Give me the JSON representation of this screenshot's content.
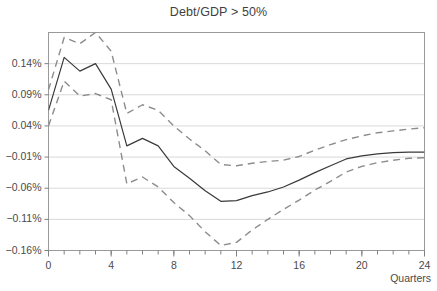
{
  "chart_data": {
    "type": "line",
    "title": "Debt/GDP > 50%",
    "xlabel": "Quarters",
    "ylabel": "",
    "xlim": [
      0,
      24
    ],
    "ylim": [
      -0.16,
      0.19
    ],
    "grid": true,
    "legend": false,
    "x": [
      0,
      1,
      2,
      3,
      4,
      5,
      6,
      7,
      8,
      9,
      10,
      11,
      12,
      13,
      14,
      15,
      16,
      17,
      18,
      19,
      20,
      21,
      22,
      23,
      24
    ],
    "xticks": [
      0,
      4,
      8,
      12,
      16,
      20,
      24
    ],
    "xtick_labels": [
      "0",
      "4",
      "8",
      "12",
      "16",
      "20",
      "24"
    ],
    "xminor_ticks": [
      0,
      1,
      2,
      3,
      4,
      5,
      6,
      7,
      8,
      9,
      10,
      11,
      12,
      13,
      14,
      15,
      16,
      17,
      18,
      19,
      20,
      21,
      22,
      23,
      24
    ],
    "yticks": [
      0.14,
      0.09,
      0.04,
      -0.01,
      -0.06,
      -0.11,
      -0.16
    ],
    "ytick_labels": [
      "0.14%",
      "0.09%",
      "0.04%",
      "−0.01%",
      "−0.06%",
      "−0.11%",
      "−0.16%"
    ],
    "series": [
      {
        "name": "point-estimate",
        "style": "solid",
        "color": "#3a3a3a",
        "values": [
          0.065,
          0.15,
          0.128,
          0.14,
          0.099,
          0.008,
          0.02,
          0.008,
          -0.025,
          -0.044,
          -0.064,
          -0.081,
          -0.08,
          -0.072,
          -0.066,
          -0.058,
          -0.047,
          -0.035,
          -0.024,
          -0.013,
          -0.008,
          -0.005,
          -0.003,
          -0.002,
          -0.002
        ]
      },
      {
        "name": "upper-confidence-band",
        "style": "dashed",
        "color": "#8c8c8c",
        "values": [
          0.098,
          0.182,
          0.172,
          0.19,
          0.16,
          0.06,
          0.074,
          0.065,
          0.04,
          0.019,
          0.0,
          -0.022,
          -0.024,
          -0.02,
          -0.017,
          -0.015,
          -0.009,
          0.001,
          0.01,
          0.018,
          0.024,
          0.029,
          0.032,
          0.035,
          0.037
        ]
      },
      {
        "name": "lower-confidence-band",
        "style": "dashed",
        "color": "#8c8c8c",
        "values": [
          0.04,
          0.112,
          0.088,
          0.092,
          0.082,
          -0.053,
          -0.042,
          -0.058,
          -0.083,
          -0.104,
          -0.13,
          -0.152,
          -0.147,
          -0.127,
          -0.11,
          -0.094,
          -0.079,
          -0.063,
          -0.049,
          -0.034,
          -0.025,
          -0.019,
          -0.015,
          -0.012,
          -0.011
        ]
      }
    ],
    "colors": {
      "axis": "#808080",
      "gridline": "#d9d9d9",
      "plot_border": "#9a9a9a",
      "background": "#ffffff"
    }
  }
}
